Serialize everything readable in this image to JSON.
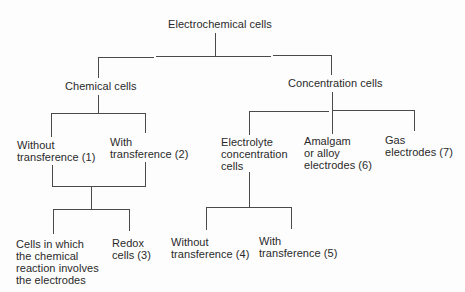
{
  "diagram": {
    "type": "tree",
    "root": {
      "id": "electrochemical",
      "label": "Electrochemical cells"
    },
    "nodes": {
      "electrochemical": {
        "label": "Electrochemical cells"
      },
      "chemical": {
        "label": "Chemical cells"
      },
      "concentration": {
        "label": "Concentration cells"
      },
      "without_transference_1": {
        "label": "Without\ntransference (1)"
      },
      "with_transference_2": {
        "label": "With\ntransference (2)"
      },
      "electrolyte_concentration": {
        "label": "Electrolyte\nconcentration\ncells"
      },
      "amalgam_alloy": {
        "label": "Amalgam\nor alloy\nelectrodes (6)"
      },
      "gas_electrodes": {
        "label": "Gas\nelectrodes (7)"
      },
      "chemical_reaction_electrodes": {
        "label": "Cells in which\nthe chemical\nreaction involves\nthe electrodes"
      },
      "redox": {
        "label": "Redox\ncells (3)"
      },
      "without_transference_4": {
        "label": "Without\ntransference (4)"
      },
      "with_transference_5": {
        "label": "With\ntransference (5)"
      }
    },
    "edges": [
      [
        "electrochemical",
        "chemical"
      ],
      [
        "electrochemical",
        "concentration"
      ],
      [
        "chemical",
        "without_transference_1"
      ],
      [
        "chemical",
        "with_transference_2"
      ],
      [
        "without_transference_1",
        "chemical_reaction_electrodes"
      ],
      [
        "with_transference_2",
        "chemical_reaction_electrodes"
      ],
      [
        "without_transference_1",
        "redox"
      ],
      [
        "with_transference_2",
        "redox"
      ],
      [
        "concentration",
        "electrolyte_concentration"
      ],
      [
        "concentration",
        "amalgam_alloy"
      ],
      [
        "concentration",
        "gas_electrodes"
      ],
      [
        "electrolyte_concentration",
        "without_transference_4"
      ],
      [
        "electrolyte_concentration",
        "with_transference_5"
      ]
    ],
    "line_color": "#4a4a4a",
    "text_color": "#2a2a2a"
  }
}
